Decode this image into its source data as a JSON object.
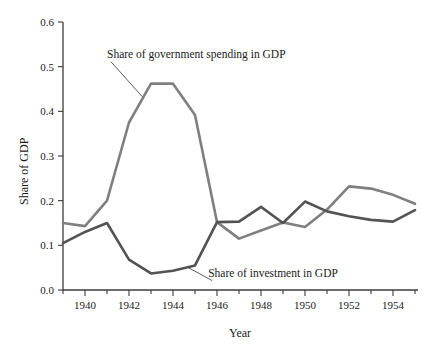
{
  "chart_data": {
    "type": "line",
    "title": "",
    "xlabel": "Year",
    "ylabel": "Share of GDP",
    "xlim": [
      1939,
      1955
    ],
    "ylim": [
      0.0,
      0.6
    ],
    "grid": false,
    "legend_position": "inline-annotations",
    "x": [
      1939,
      1940,
      1941,
      1942,
      1943,
      1944,
      1945,
      1946,
      1947,
      1948,
      1949,
      1950,
      1951,
      1952,
      1953,
      1954,
      1955
    ],
    "xticks_major": [
      "1940",
      "1942",
      "1944",
      "1946",
      "1948",
      "1950",
      "1952",
      "1954"
    ],
    "yticks": [
      "0.0",
      "0.1",
      "0.2",
      "0.3",
      "0.4",
      "0.5",
      "0.6"
    ],
    "series": [
      {
        "name": "Share of government spending in GDP",
        "color": "#7f7f7f",
        "values": [
          0.15,
          0.143,
          0.2,
          0.375,
          0.462,
          0.462,
          0.392,
          0.152,
          0.115,
          0.133,
          0.151,
          0.141,
          0.18,
          0.232,
          0.227,
          0.213,
          0.193
        ]
      },
      {
        "name": "Share of investment in GDP",
        "color": "#535353",
        "values": [
          0.105,
          0.13,
          0.15,
          0.068,
          0.037,
          0.043,
          0.055,
          0.152,
          0.153,
          0.186,
          0.15,
          0.198,
          0.176,
          0.165,
          0.157,
          0.153,
          0.179
        ]
      }
    ],
    "annotations": [
      {
        "text": "Share of government spending in GDP",
        "target_x": 1942.6,
        "target_y": 0.433,
        "label_x": 1941.0,
        "label_y": 0.52
      },
      {
        "text": "Share of investment in GDP",
        "target_x": 1944.7,
        "target_y": 0.05,
        "label_x": 1945.6,
        "label_y": 0.03
      }
    ]
  },
  "axes": {
    "x_title": "Year",
    "y_title": "Share of GDP"
  }
}
